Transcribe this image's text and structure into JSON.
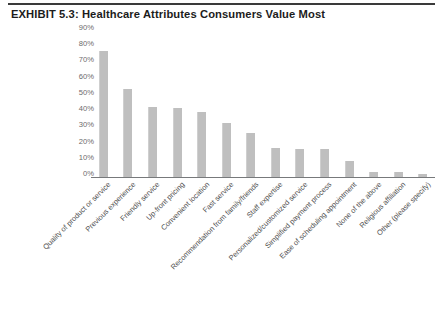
{
  "document": {
    "exhibit_title": "EXHIBIT 5.3: Healthcare Attributes Consumers Value Most"
  },
  "style": {
    "bar_color": "#bfbfbf",
    "axis_color": "#77797b",
    "rule_color": "#3a3a3a",
    "tick_text_color": "#6b6b6b",
    "label_text_color": "#4f4f4f",
    "background": "#ffffff"
  },
  "chart_data": {
    "type": "bar",
    "title": "EXHIBIT 5.3: Healthcare Attributes Consumers Value Most",
    "xlabel": "",
    "ylabel": "",
    "ylim": [
      0,
      90
    ],
    "ytick_labels": [
      "90%",
      "80%",
      "70%",
      "60%",
      "50%",
      "40%",
      "30%",
      "20%",
      "10%",
      "0%"
    ],
    "ytick_values": [
      90,
      80,
      70,
      60,
      50,
      40,
      30,
      20,
      10,
      0
    ],
    "grid": false,
    "legend": "none",
    "orientation": "vertical",
    "categories": [
      "Quality of product or service",
      "Previous experience",
      "Friendly service",
      "Up-front pricing",
      "Convenient location",
      "Fast service",
      "Recommendation from family/friends",
      "Staff expertise",
      "Personalized/customized service",
      "Simplified payment process",
      "Ease of scheduling appointment",
      "None of the above",
      "Religious affiliation",
      "Other (please specify)"
    ],
    "values": [
      77,
      54,
      43,
      42,
      40,
      33,
      27,
      18,
      17,
      17,
      10,
      3,
      3,
      2
    ]
  }
}
